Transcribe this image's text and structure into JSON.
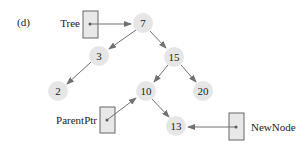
{
  "figure": {
    "panel_label": "(d)",
    "colors": {
      "node_fill": "#e6e6e6",
      "edge": "#707070",
      "pointer_box_fill": "#e8e8e8",
      "pointer_box_stroke": "#666666",
      "text": "#222222"
    },
    "nodes": [
      {
        "id": "n7",
        "label": "7",
        "x": 143,
        "y": 23
      },
      {
        "id": "n3",
        "label": "3",
        "x": 99,
        "y": 56
      },
      {
        "id": "n15",
        "label": "15",
        "x": 174,
        "y": 57
      },
      {
        "id": "n2",
        "label": "2",
        "x": 58,
        "y": 91
      },
      {
        "id": "n10",
        "label": "10",
        "x": 146,
        "y": 91
      },
      {
        "id": "n20",
        "label": "20",
        "x": 203,
        "y": 91
      },
      {
        "id": "n13",
        "label": "13",
        "x": 176,
        "y": 126
      }
    ],
    "edges": [
      {
        "from": "7",
        "to": "3"
      },
      {
        "from": "7",
        "to": "15"
      },
      {
        "from": "3",
        "to": "2"
      },
      {
        "from": "15",
        "to": "10"
      },
      {
        "from": "15",
        "to": "20"
      },
      {
        "from": "10",
        "to": "13"
      }
    ],
    "pointers": [
      {
        "name": "Tree",
        "label": "Tree",
        "points_to": "7"
      },
      {
        "name": "ParentPtr",
        "label": "ParentPtr",
        "points_to": "10"
      },
      {
        "name": "NewNode",
        "label": "NewNode",
        "points_to": "13"
      }
    ]
  }
}
